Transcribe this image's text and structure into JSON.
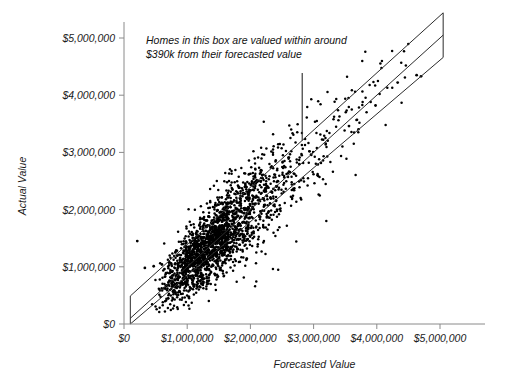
{
  "chart_data": {
    "type": "scatter",
    "title": "",
    "xlabel": "Forecasted Value",
    "ylabel": "Actual Value",
    "xlim": [
      0,
      5000000
    ],
    "ylim": [
      0,
      5000000
    ],
    "grid": false,
    "legend": null,
    "xticks": [
      0,
      1000000,
      2000000,
      3000000,
      4000000,
      5000000
    ],
    "xtick_labels": [
      "$0",
      "$1,000,000",
      "$2,000,000",
      "$3,000,000",
      "$4,000,000",
      "$5,000,000"
    ],
    "yticks": [
      0,
      1000000,
      2000000,
      3000000,
      4000000,
      5000000
    ],
    "ytick_labels": [
      "$0",
      "$1,000,000",
      "$2,000,000",
      "$3,000,000",
      "$4,000,000",
      "$5,000,000"
    ],
    "annotations": [
      {
        "name": "band-callout",
        "line1": "Homes in this box are valued within around",
        "line2": "$390k from their forecasted value",
        "leader_from_x": 2820000,
        "leader_from_y": 4390000,
        "leader_to_x": 2820000,
        "leader_to_y": 3210000
      }
    ],
    "reference_lines": [
      {
        "name": "identity-line",
        "slope": 1,
        "intercept": 0,
        "label": "y = x"
      },
      {
        "name": "upper-band-line",
        "slope": 1,
        "intercept": 390000,
        "label": "+$390k"
      },
      {
        "name": "lower-band-line",
        "slope": 1,
        "intercept": -390000,
        "label": "-$390k"
      }
    ],
    "band": {
      "name": "accuracy-band",
      "half_width": 390000,
      "half_width_label": "$390k",
      "x_start": 100000,
      "x_end": 5050000
    },
    "series": [
      {
        "name": "Homes",
        "marker": "filled-circle",
        "color": "#000000",
        "n_points": 2100,
        "x_center": 1480000,
        "y_center": 1520000,
        "correlation": 0.93,
        "x_spread": 560000,
        "residual_spread": 300000,
        "x_min": 120000,
        "x_max": 4700000,
        "y_min": 60000,
        "y_max": 4400000
      }
    ],
    "outliers": [
      {
        "x": 210000,
        "y": 1450000
      },
      {
        "x": 330000,
        "y": 980000
      },
      {
        "x": 470000,
        "y": 1010000
      },
      {
        "x": 600000,
        "y": 1040000
      },
      {
        "x": 640000,
        "y": 960000
      },
      {
        "x": 4330000,
        "y": 4220000
      },
      {
        "x": 4700000,
        "y": 4330000
      },
      {
        "x": 4630000,
        "y": 4350000
      },
      {
        "x": 3980000,
        "y": 3820000
      },
      {
        "x": 3560000,
        "y": 3460000
      }
    ]
  },
  "axes": {
    "x_title": "Forecasted Value",
    "y_title": "Actual Value"
  }
}
